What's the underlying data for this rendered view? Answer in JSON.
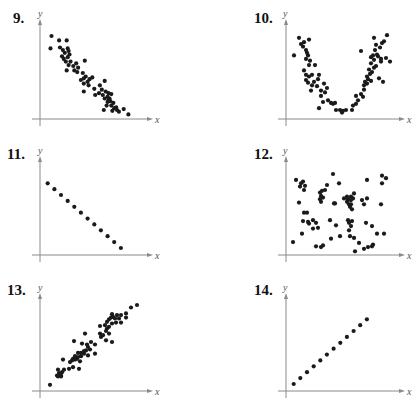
{
  "chart_data": [
    {
      "type": "scatter",
      "title": "9.",
      "xlabel": "x",
      "ylabel": "y",
      "xlim": [
        0,
        10
      ],
      "ylim": [
        0,
        10
      ],
      "grid": false,
      "description": "strong negative linear correlation",
      "points": [
        [
          1.0,
          9.2
        ],
        [
          0.9,
          7.8
        ],
        [
          1.8,
          8.7
        ],
        [
          2.6,
          8.7
        ],
        [
          1.9,
          7.9
        ],
        [
          2.2,
          7.6
        ],
        [
          2.4,
          7.3
        ],
        [
          2.7,
          7.8
        ],
        [
          2.8,
          7.5
        ],
        [
          2.1,
          6.9
        ],
        [
          2.3,
          6.6
        ],
        [
          2.5,
          6.3
        ],
        [
          2.7,
          6.8
        ],
        [
          2.9,
          7.1
        ],
        [
          3.0,
          6.3
        ],
        [
          2.8,
          5.9
        ],
        [
          2.6,
          5.3
        ],
        [
          3.3,
          5.8
        ],
        [
          3.6,
          6.1
        ],
        [
          3.4,
          5.3
        ],
        [
          3.8,
          5.6
        ],
        [
          4.5,
          6.4
        ],
        [
          3.7,
          5.1
        ],
        [
          4.3,
          5.0
        ],
        [
          4.4,
          4.4
        ],
        [
          4.6,
          4.6
        ],
        [
          4.1,
          4.2
        ],
        [
          4.8,
          4.0
        ],
        [
          5.0,
          4.3
        ],
        [
          5.3,
          4.5
        ],
        [
          4.4,
          3.8
        ],
        [
          4.9,
          3.6
        ],
        [
          5.5,
          3.2
        ],
        [
          4.4,
          2.9
        ],
        [
          5.6,
          2.5
        ],
        [
          6.1,
          3.6
        ],
        [
          6.6,
          4.1
        ],
        [
          6.3,
          3.1
        ],
        [
          6.4,
          2.5
        ],
        [
          6.0,
          2.7
        ],
        [
          6.7,
          2.9
        ],
        [
          7.0,
          2.7
        ],
        [
          7.3,
          2.6
        ],
        [
          6.9,
          2.3
        ],
        [
          6.6,
          2.1
        ],
        [
          7.1,
          2.1
        ],
        [
          7.2,
          1.8
        ],
        [
          6.9,
          1.7
        ],
        [
          7.5,
          1.6
        ],
        [
          7.3,
          1.3
        ],
        [
          6.8,
          1.3
        ],
        [
          7.6,
          1.0
        ],
        [
          7.8,
          1.1
        ],
        [
          7.9,
          0.8
        ],
        [
          6.5,
          0.8
        ],
        [
          8.1,
          0.6
        ],
        [
          8.6,
          0.9
        ],
        [
          7.4,
          0.7
        ],
        [
          9.1,
          0.3
        ],
        [
          7.0,
          1.9
        ]
      ]
    },
    {
      "type": "scatter",
      "title": "10.",
      "xlabel": "x",
      "ylabel": "y",
      "xlim": [
        0,
        10
      ],
      "ylim": [
        0,
        10
      ],
      "grid": false,
      "description": "quadratic (U-shaped) relationship",
      "points": [
        [
          0.6,
          7.0
        ],
        [
          1.1,
          9.0
        ],
        [
          1.3,
          8.3
        ],
        [
          1.5,
          8.0
        ],
        [
          1.6,
          8.5
        ],
        [
          2.1,
          8.8
        ],
        [
          1.8,
          7.6
        ],
        [
          1.9,
          7.3
        ],
        [
          2.0,
          7.0
        ],
        [
          1.8,
          6.6
        ],
        [
          2.2,
          6.4
        ],
        [
          2.1,
          5.9
        ],
        [
          2.7,
          5.9
        ],
        [
          1.6,
          5.3
        ],
        [
          1.8,
          4.8
        ],
        [
          2.1,
          4.6
        ],
        [
          2.4,
          4.8
        ],
        [
          1.8,
          4.2
        ],
        [
          2.0,
          3.9
        ],
        [
          2.4,
          3.6
        ],
        [
          2.6,
          4.0
        ],
        [
          3.1,
          4.8
        ],
        [
          3.0,
          4.3
        ],
        [
          2.3,
          3.0
        ],
        [
          2.9,
          3.5
        ],
        [
          3.3,
          3.0
        ],
        [
          3.6,
          3.8
        ],
        [
          3.9,
          3.3
        ],
        [
          3.7,
          2.8
        ],
        [
          3.3,
          2.4
        ],
        [
          3.5,
          1.7
        ],
        [
          3.1,
          1.0
        ],
        [
          4.0,
          1.9
        ],
        [
          4.3,
          1.6
        ],
        [
          4.5,
          1.5
        ],
        [
          4.7,
          1.6
        ],
        [
          4.8,
          0.8
        ],
        [
          5.2,
          0.8
        ],
        [
          5.5,
          0.7
        ],
        [
          5.4,
          0.5
        ],
        [
          5.8,
          0.8
        ],
        [
          6.4,
          0.8
        ],
        [
          6.5,
          1.3
        ],
        [
          6.8,
          1.5
        ],
        [
          7.0,
          1.9
        ],
        [
          6.8,
          2.4
        ],
        [
          7.3,
          2.6
        ],
        [
          7.5,
          2.3
        ],
        [
          7.6,
          3.1
        ],
        [
          7.9,
          3.8
        ],
        [
          7.6,
          3.6
        ],
        [
          7.7,
          4.0
        ],
        [
          8.0,
          4.3
        ],
        [
          8.3,
          4.1
        ],
        [
          7.9,
          4.6
        ],
        [
          8.2,
          4.9
        ],
        [
          8.4,
          5.1
        ],
        [
          8.6,
          5.6
        ],
        [
          8.1,
          5.4
        ],
        [
          8.8,
          5.8
        ],
        [
          8.3,
          6.1
        ],
        [
          8.6,
          6.5
        ],
        [
          8.9,
          7.1
        ],
        [
          8.5,
          7.0
        ],
        [
          8.7,
          7.6
        ],
        [
          9.0,
          6.9
        ],
        [
          9.3,
          6.6
        ],
        [
          9.2,
          7.9
        ],
        [
          9.4,
          8.4
        ],
        [
          8.8,
          8.2
        ],
        [
          9.6,
          8.6
        ],
        [
          9.9,
          9.3
        ],
        [
          9.3,
          6.3
        ],
        [
          10.2,
          6.3
        ],
        [
          9.5,
          4.0
        ],
        [
          9.1,
          4.4
        ],
        [
          7.3,
          7.5
        ],
        [
          8.6,
          9.0
        ],
        [
          9.8,
          6.7
        ],
        [
          8.3,
          6.8
        ]
      ]
    },
    {
      "type": "scatter",
      "title": "11.",
      "xlabel": "x",
      "ylabel": "y",
      "xlim": [
        0,
        10
      ],
      "ylim": [
        0,
        10
      ],
      "grid": false,
      "description": "perfect negative linear correlation",
      "points": [
        [
          0.6,
          8.3
        ],
        [
          1.3,
          7.6
        ],
        [
          2.0,
          6.9
        ],
        [
          2.7,
          6.2
        ],
        [
          3.4,
          5.5
        ],
        [
          4.1,
          4.8
        ],
        [
          4.8,
          4.1
        ],
        [
          5.5,
          3.4
        ],
        [
          6.2,
          2.7
        ],
        [
          6.9,
          2.0
        ],
        [
          7.6,
          1.3
        ],
        [
          8.3,
          0.6
        ]
      ]
    },
    {
      "type": "scatter",
      "title": "12.",
      "xlabel": "x",
      "ylabel": "y",
      "xlim": [
        0,
        10
      ],
      "ylim": [
        0,
        10
      ],
      "grid": false,
      "description": "no correlation",
      "points": [
        [
          0.8,
          8.7
        ],
        [
          1.3,
          8.3
        ],
        [
          1.5,
          8.5
        ],
        [
          1.2,
          7.9
        ],
        [
          1.7,
          8.0
        ],
        [
          1.6,
          7.5
        ],
        [
          1.1,
          6.0
        ],
        [
          0.5,
          1.3
        ],
        [
          1.6,
          4.8
        ],
        [
          1.9,
          4.8
        ],
        [
          1.5,
          3.8
        ],
        [
          2.0,
          3.7
        ],
        [
          2.1,
          3.5
        ],
        [
          2.5,
          3.9
        ],
        [
          2.8,
          3.6
        ],
        [
          2.5,
          2.9
        ],
        [
          3.0,
          3.0
        ],
        [
          1.4,
          2.3
        ],
        [
          3.2,
          7.2
        ],
        [
          3.4,
          7.4
        ],
        [
          3.3,
          6.8
        ],
        [
          3.5,
          6.6
        ],
        [
          3.7,
          7.5
        ],
        [
          3.9,
          8.1
        ],
        [
          3.2,
          6.4
        ],
        [
          3.3,
          6.1
        ],
        [
          2.8,
          0.8
        ],
        [
          3.3,
          0.7
        ],
        [
          3.5,
          0.9
        ],
        [
          4.2,
          3.9
        ],
        [
          4.5,
          9.4
        ],
        [
          5.1,
          8.3
        ],
        [
          4.6,
          5.9
        ],
        [
          4.7,
          5.9
        ],
        [
          4.8,
          3.3
        ],
        [
          4.3,
          1.7
        ],
        [
          5.2,
          2.0
        ],
        [
          5.6,
          6.5
        ],
        [
          5.9,
          6.7
        ],
        [
          6.3,
          6.7
        ],
        [
          6.0,
          6.3
        ],
        [
          5.9,
          6.1
        ],
        [
          6.1,
          5.8
        ],
        [
          6.3,
          6.3
        ],
        [
          6.5,
          6.5
        ],
        [
          6.3,
          5.8
        ],
        [
          6.4,
          5.2
        ],
        [
          6.0,
          3.9
        ],
        [
          6.1,
          3.6
        ],
        [
          6.3,
          3.2
        ],
        [
          6.1,
          2.7
        ],
        [
          6.4,
          3.8
        ],
        [
          6.6,
          7.1
        ],
        [
          6.2,
          2.0
        ],
        [
          6.6,
          1.8
        ],
        [
          6.7,
          0.2
        ],
        [
          7.1,
          1.2
        ],
        [
          7.4,
          6.3
        ],
        [
          7.6,
          5.8
        ],
        [
          7.9,
          6.5
        ],
        [
          7.9,
          8.7
        ],
        [
          7.8,
          3.6
        ],
        [
          8.4,
          3.2
        ],
        [
          7.6,
          0.5
        ],
        [
          8.0,
          0.7
        ],
        [
          8.4,
          0.8
        ],
        [
          8.5,
          1.0
        ],
        [
          8.9,
          2.3
        ],
        [
          9.6,
          2.3
        ],
        [
          9.3,
          5.8
        ],
        [
          9.4,
          9.2
        ],
        [
          9.8,
          8.9
        ],
        [
          9.4,
          8.3
        ],
        [
          6.0,
          6.4
        ],
        [
          6.2,
          5.5
        ]
      ]
    },
    {
      "type": "scatter",
      "title": "13.",
      "xlabel": "x",
      "ylabel": "y",
      "xlim": [
        0,
        10
      ],
      "ylim": [
        0,
        10
      ],
      "grid": false,
      "description": "strong positive linear correlation",
      "points": [
        [
          0.8,
          0.5
        ],
        [
          1.5,
          1.6
        ],
        [
          1.6,
          1.5
        ],
        [
          1.7,
          1.9
        ],
        [
          1.9,
          1.5
        ],
        [
          1.8,
          1.7
        ],
        [
          2.0,
          2.0
        ],
        [
          1.9,
          1.6
        ],
        [
          1.6,
          2.3
        ],
        [
          2.2,
          2.3
        ],
        [
          2.7,
          2.4
        ],
        [
          2.1,
          3.5
        ],
        [
          2.8,
          3.2
        ],
        [
          3.0,
          3.4
        ],
        [
          3.1,
          3.6
        ],
        [
          3.3,
          3.5
        ],
        [
          3.5,
          3.6
        ],
        [
          3.3,
          3.9
        ],
        [
          3.6,
          3.8
        ],
        [
          3.1,
          2.6
        ],
        [
          3.6,
          4.3
        ],
        [
          3.9,
          4.3
        ],
        [
          3.9,
          3.9
        ],
        [
          4.2,
          4.2
        ],
        [
          4.4,
          4.6
        ],
        [
          4.5,
          5.3
        ],
        [
          4.6,
          4.0
        ],
        [
          4.2,
          4.5
        ],
        [
          3.8,
          3.3
        ],
        [
          3.7,
          2.4
        ],
        [
          3.2,
          5.7
        ],
        [
          4.0,
          5.4
        ],
        [
          4.3,
          6.6
        ],
        [
          4.6,
          5.0
        ],
        [
          4.8,
          4.7
        ],
        [
          4.9,
          5.6
        ],
        [
          5.3,
          4.2
        ],
        [
          5.3,
          5.3
        ],
        [
          5.8,
          6.6
        ],
        [
          5.9,
          6.2
        ],
        [
          6.1,
          6.4
        ],
        [
          5.8,
          7.5
        ],
        [
          6.3,
          7.6
        ],
        [
          6.4,
          6.9
        ],
        [
          6.5,
          7.2
        ],
        [
          6.7,
          7.4
        ],
        [
          6.5,
          8.0
        ],
        [
          6.7,
          8.3
        ],
        [
          6.9,
          8.5
        ],
        [
          7.0,
          8.9
        ],
        [
          7.1,
          8.6
        ],
        [
          7.3,
          8.4
        ],
        [
          7.5,
          8.8
        ],
        [
          6.7,
          6.6
        ],
        [
          7.0,
          7.8
        ],
        [
          7.0,
          5.6
        ],
        [
          6.4,
          5.8
        ],
        [
          7.4,
          7.9
        ],
        [
          7.9,
          7.9
        ],
        [
          8.4,
          8.5
        ],
        [
          8.4,
          9.0
        ],
        [
          8.9,
          9.7
        ],
        [
          9.5,
          10.0
        ],
        [
          7.9,
          8.8
        ],
        [
          7.7,
          8.4
        ]
      ]
    },
    {
      "type": "scatter",
      "title": "14.",
      "xlabel": "x",
      "ylabel": "y",
      "xlim": [
        0,
        10
      ],
      "ylim": [
        0,
        10
      ],
      "grid": false,
      "description": "perfect positive linear correlation",
      "points": [
        [
          0.6,
          0.6
        ],
        [
          1.3,
          1.3
        ],
        [
          2.0,
          2.0
        ],
        [
          2.7,
          2.7
        ],
        [
          3.4,
          3.4
        ],
        [
          4.1,
          4.1
        ],
        [
          4.8,
          4.8
        ],
        [
          5.5,
          5.5
        ],
        [
          6.2,
          6.2
        ],
        [
          6.9,
          6.9
        ],
        [
          7.6,
          7.6
        ],
        [
          8.3,
          8.3
        ]
      ]
    }
  ]
}
